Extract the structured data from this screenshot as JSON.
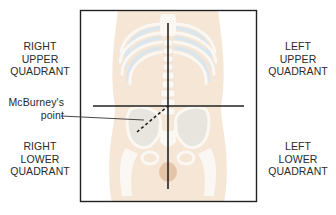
{
  "figure": {
    "quadrant_labels": {
      "right_upper": [
        "RIGHT",
        "UPPER",
        "QUADRANT"
      ],
      "left_upper": [
        "LEFT",
        "UPPER",
        "QUADRANT"
      ],
      "right_lower": [
        "RIGHT",
        "LOWER",
        "QUADRANT"
      ],
      "left_lower": [
        "LEFT",
        "LOWER",
        "QUADRANT"
      ]
    },
    "annotation": {
      "lines": [
        "McBurney's",
        "point"
      ]
    },
    "colors": {
      "skin": "#f6e6d6",
      "bone": "#fbf7f2",
      "cartilage": "#dbe6ec",
      "line": "#222222",
      "text": "#2a2a2a"
    }
  }
}
